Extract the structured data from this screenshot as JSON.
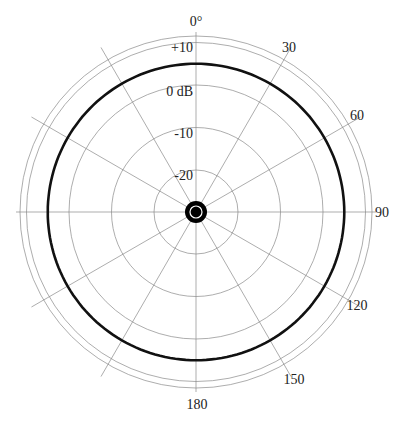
{
  "chart_data": {
    "type": "polar",
    "title": "",
    "angle_unit": "degrees",
    "angle_labels": [
      {
        "angle": 0,
        "label": "0°"
      },
      {
        "angle": 30,
        "label": "30"
      },
      {
        "angle": 60,
        "label": "60"
      },
      {
        "angle": 90,
        "label": "90"
      },
      {
        "angle": 120,
        "label": "120"
      },
      {
        "angle": 150,
        "label": "150"
      },
      {
        "angle": 180,
        "label": "180"
      }
    ],
    "spoke_angles": [
      0,
      30,
      60,
      90,
      120,
      150,
      180,
      210,
      240,
      270,
      300,
      330
    ],
    "radial_rings": [
      {
        "value": -20,
        "label": "-20"
      },
      {
        "value": -10,
        "label": "-10"
      },
      {
        "value": 0,
        "label": "0 dB"
      },
      {
        "value": 10,
        "label": "+10"
      }
    ],
    "radial_unit": "dB",
    "rlim": [
      -30,
      10
    ],
    "series": [
      {
        "name": "omnidirectional pattern",
        "pattern": "circle",
        "angles": [
          0,
          30,
          60,
          90,
          120,
          150,
          180,
          210,
          240,
          270,
          300,
          330
        ],
        "values_db": [
          5,
          5,
          5,
          5,
          5,
          5,
          5,
          5,
          5,
          5,
          5,
          5
        ]
      }
    ],
    "grid": true,
    "legend": null
  },
  "colors": {
    "grid": "#8a8a8a",
    "pattern": "#111111",
    "center_marker": "#000000"
  }
}
